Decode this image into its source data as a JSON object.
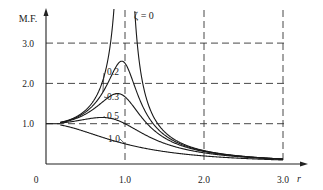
{
  "chart_data": {
    "type": "line",
    "title": "",
    "xlabel": "r",
    "ylabel": "M.F.",
    "xlim": [
      0,
      3.2
    ],
    "ylim": [
      0,
      3.9
    ],
    "grid": "dashed lines at x=1.0, 2.0, 3.0 and y=1.0, 2.0, 3.0",
    "x_origin_label": "0",
    "x_ticks": [
      {
        "value": 1.0,
        "label": "1.0"
      },
      {
        "value": 2.0,
        "label": "2.0"
      },
      {
        "value": 3.0,
        "label": "3.0"
      }
    ],
    "y_ticks": [
      {
        "value": 1.0,
        "label": "1.0"
      },
      {
        "value": 2.0,
        "label": "2.0"
      },
      {
        "value": 3.0,
        "label": "3.0"
      }
    ],
    "formula": "M.F. = 1 / sqrt((1 - r^2)^2 + (2*zeta*r)^2)",
    "series": [
      {
        "name": "ζ = 0",
        "zeta": 0.0,
        "label": "ζ = 0",
        "note": "unbounded resonance at r = 1"
      },
      {
        "name": "0.2",
        "zeta": 0.2,
        "label": "0.2",
        "peak": 2.55
      },
      {
        "name": "0.3",
        "zeta": 0.3,
        "label": "0.3",
        "peak": 1.75
      },
      {
        "name": "0.5",
        "zeta": 0.5,
        "label": "0.5",
        "value_at_r1": 1.0
      },
      {
        "name": "1.0",
        "zeta": 1.0,
        "label": "1.0",
        "value_at_r1": 0.5
      }
    ],
    "legend": "inline labels on curves"
  }
}
